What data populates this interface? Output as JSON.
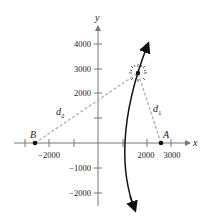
{
  "figure": {
    "axes": {
      "x_label": "x",
      "y_label": "y",
      "x_ticks": [
        {
          "value": -3000,
          "px": 25,
          "label": ""
        },
        {
          "value": -2000,
          "px": 49,
          "label": "−2000"
        },
        {
          "value": -1000,
          "px": 74,
          "label": ""
        },
        {
          "value": 1000,
          "px": 123,
          "label": ""
        },
        {
          "value": 2000,
          "px": 147,
          "label": "2000"
        },
        {
          "value": 3000,
          "px": 171,
          "label": "3000"
        }
      ],
      "y_ticks": [
        {
          "value": 4000,
          "px": 44,
          "label": "4000"
        },
        {
          "value": 3000,
          "px": 69,
          "label": "3000"
        },
        {
          "value": 2000,
          "px": 93,
          "label": "2000"
        },
        {
          "value": 1000,
          "px": 118,
          "label": ""
        },
        {
          "value": -1000,
          "px": 168,
          "label": "−1000"
        },
        {
          "value": -2000,
          "px": 193,
          "label": "−2000"
        }
      ]
    },
    "points": {
      "A": {
        "label": "A",
        "x": 2600,
        "y": 0
      },
      "B": {
        "label": "B",
        "x": -2300,
        "y": 0
      },
      "source": {
        "label": "",
        "x": 1700,
        "y": 2900
      }
    },
    "distances": {
      "d1": {
        "label": "d",
        "subscript": "1"
      },
      "d2": {
        "label": "d",
        "subscript": "2"
      }
    },
    "curve": "hyperbola branch"
  }
}
